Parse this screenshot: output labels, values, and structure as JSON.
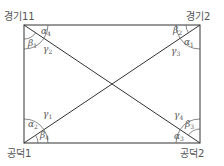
{
  "diagram": {
    "type": "rectangle-with-diagonals",
    "corners": {
      "top_left": "경기11",
      "top_right": "경기2",
      "bottom_left": "공덕1",
      "bottom_right": "공덕2"
    },
    "angles": {
      "top_left": [
        {
          "sym": "α",
          "sub": "4"
        },
        {
          "sym": "β",
          "sub": "1"
        },
        {
          "sym": "γ",
          "sub": "2"
        }
      ],
      "top_right": [
        {
          "sym": "β",
          "sub": "2"
        },
        {
          "sym": "α",
          "sub": "1"
        },
        {
          "sym": "γ",
          "sub": "3"
        }
      ],
      "bottom_left": [
        {
          "sym": "γ",
          "sub": "1"
        },
        {
          "sym": "α",
          "sub": "2"
        },
        {
          "sym": "β",
          "sub": "4"
        }
      ],
      "bottom_right": [
        {
          "sym": "γ",
          "sub": "4"
        },
        {
          "sym": "β",
          "sub": "3"
        },
        {
          "sym": "α",
          "sub": "3"
        }
      ]
    },
    "colors": {
      "line": "#333333",
      "text": "#555555"
    }
  }
}
